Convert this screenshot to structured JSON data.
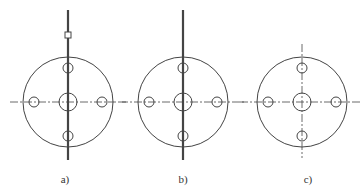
{
  "figure": {
    "stroke_color": "#444444",
    "background": "#ffffff",
    "panels": [
      {
        "id": "a",
        "label": "a)",
        "cx": 68,
        "cy": 102,
        "outer_r": 45,
        "center_hole_r": 9,
        "bolt_hole_r": 5,
        "bolt_offset": 34,
        "vertical_axis": {
          "style": "thick-solid",
          "y1": 10,
          "y2": 160
        },
        "horizontal_axis": {
          "style": "dash-dot",
          "x1": 10,
          "x2": 126
        },
        "marker": {
          "type": "small-rect",
          "y": 35
        }
      },
      {
        "id": "b",
        "label": "b)",
        "cx": 183,
        "cy": 102,
        "outer_r": 45,
        "center_hole_r": 9,
        "bolt_hole_r": 5,
        "bolt_offset": 34,
        "vertical_axis": {
          "style": "thick-solid",
          "y1": 10,
          "y2": 160
        },
        "horizontal_axis": {
          "style": "dash-dot",
          "x1": 120,
          "x2": 246
        }
      },
      {
        "id": "c",
        "label": "c)",
        "cx": 302,
        "cy": 102,
        "outer_r": 45,
        "center_hole_r": 9,
        "bolt_hole_r": 5,
        "bolt_offset": 34,
        "vertical_axis": {
          "style": "dash-dot",
          "y1": 44,
          "y2": 158
        },
        "horizontal_axis": {
          "style": "dash-dot",
          "x1": 240,
          "x2": 362
        }
      }
    ]
  }
}
